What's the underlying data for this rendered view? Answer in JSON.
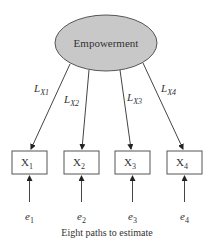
{
  "diagram": {
    "latent": {
      "label": "Empowerment",
      "fill": "#c8c8c8"
    },
    "loadings": [
      {
        "label": "L",
        "sub": "X1"
      },
      {
        "label": "L",
        "sub": "X2"
      },
      {
        "label": "L",
        "sub": "X3"
      },
      {
        "label": "L",
        "sub": "X4"
      }
    ],
    "indicators": [
      {
        "label": "X",
        "sub": "1"
      },
      {
        "label": "X",
        "sub": "2"
      },
      {
        "label": "X",
        "sub": "3"
      },
      {
        "label": "X",
        "sub": "4"
      }
    ],
    "errors": [
      {
        "label": "e",
        "sub": "1"
      },
      {
        "label": "e",
        "sub": "2"
      },
      {
        "label": "e",
        "sub": "3"
      },
      {
        "label": "e",
        "sub": "4"
      }
    ],
    "caption": "Eight paths to estimate"
  }
}
